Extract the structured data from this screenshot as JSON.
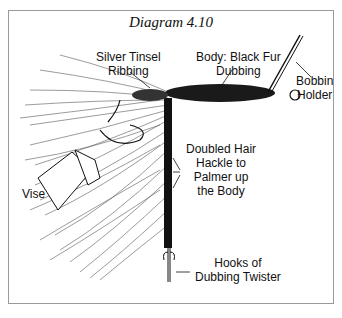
{
  "title": "Diagram 4.10",
  "labels": {
    "silver_tinsel": [
      "Silver Tinsel",
      "Ribbing"
    ],
    "body": [
      "Body: Black Fur",
      "Dubbing"
    ],
    "bobbin": [
      "Bobbin",
      "Holder"
    ],
    "hackle": [
      "Doubled Hair",
      "Hackle to",
      "Palmer up",
      "the Body"
    ],
    "vise": "Vise",
    "hooks": [
      "Hooks of",
      "Dubbing Twister"
    ]
  },
  "colors": {
    "ink": "#111111",
    "border": "#9a9a9a",
    "background": "#ffffff"
  }
}
